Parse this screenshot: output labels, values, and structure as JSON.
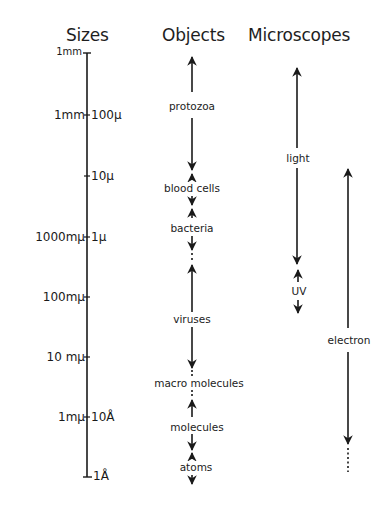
{
  "headers": {
    "sizes": "Sizes",
    "objects": "Objects",
    "microscopes": "Microscopes"
  },
  "sizes": {
    "ticks": [
      {
        "left": "1mm",
        "right": "",
        "y": 53
      },
      {
        "left": "1mm",
        "right": "100µ",
        "y": 115
      },
      {
        "left": "",
        "right": "10µ",
        "y": 176
      },
      {
        "left": "1000mµ",
        "right": "1µ",
        "y": 237
      },
      {
        "left": "100mµ",
        "right": "",
        "y": 297
      },
      {
        "left": "10 mµ",
        "right": "",
        "y": 357
      },
      {
        "left": "1mµ",
        "right": "10Å",
        "y": 417
      },
      {
        "left": "",
        "right": "1Å",
        "y": 477
      }
    ]
  },
  "objects": {
    "items": [
      {
        "label": "protozoa"
      },
      {
        "label": "blood cells"
      },
      {
        "label": "bacteria"
      },
      {
        "label": "viruses"
      },
      {
        "label": "macro molecules"
      },
      {
        "label": "molecules"
      },
      {
        "label": "atoms"
      }
    ]
  },
  "microscopes": {
    "items": [
      {
        "label": "light"
      },
      {
        "label": "UV"
      },
      {
        "label": "electron"
      }
    ]
  },
  "colors": {
    "ink": "#1a1a1a",
    "background": "#ffffff"
  }
}
